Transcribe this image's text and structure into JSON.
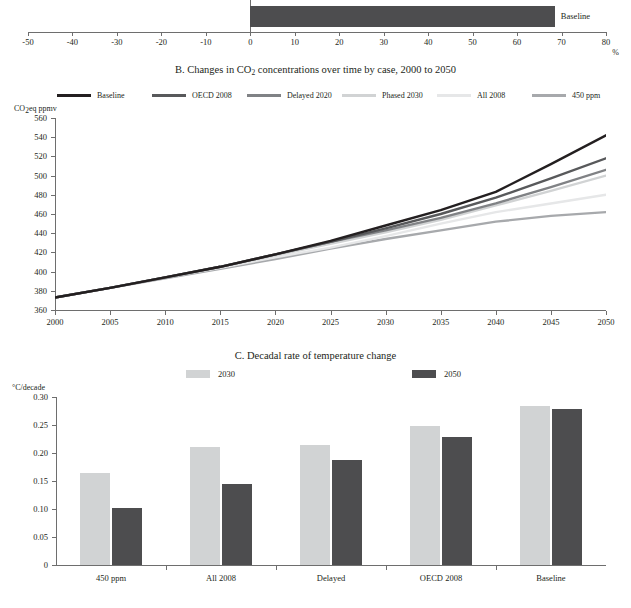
{
  "panel_a": {
    "series_label": "Baseline",
    "axis_unit": "%",
    "ticks": [
      "-50",
      "-40",
      "-30",
      "-20",
      "-10",
      "0",
      "10",
      "20",
      "30",
      "40",
      "50",
      "60",
      "70",
      "80"
    ],
    "bar_color": "#4d4d4f"
  },
  "panel_b": {
    "title_prefix": "B. Changes in CO",
    "title_sub": "2",
    "title_suffix": " concentrations over time by case, 2000 to 2050",
    "title_full": "B. Changes in CO2 concentrations over time by case, 2000 to 2050",
    "y_axis_label_prefix": "CO",
    "y_axis_label_sub": "2",
    "y_axis_label_suffix": "eq ppmv",
    "legend": [
      {
        "label": "Baseline",
        "color": "#231f20"
      },
      {
        "label": "OECD 2008",
        "color": "#58595b"
      },
      {
        "label": "Delayed 2020",
        "color": "#808285"
      },
      {
        "label": "Phased 2030",
        "color": "#d1d3d4"
      },
      {
        "label": "All 2008",
        "color": "#e6e7e8"
      },
      {
        "label": "450 ppm",
        "color": "#a7a9ac"
      }
    ]
  },
  "panel_c": {
    "title": "C. Decadal rate of temperature change",
    "y_axis_label": "°C/decade",
    "legend": [
      {
        "label": "2030",
        "color": "#d1d3d4"
      },
      {
        "label": "2050",
        "color": "#4d4d4f"
      }
    ]
  },
  "chart_data": [
    {
      "type": "bar",
      "id": "panel-a",
      "orientation": "horizontal",
      "title": "",
      "xlabel": "%",
      "ylabel": "",
      "categories": [
        "Baseline"
      ],
      "values": [
        68.5
      ],
      "xlim": [
        -50,
        80
      ],
      "xticks": [
        -50,
        -40,
        -30,
        -20,
        -10,
        0,
        10,
        20,
        30,
        40,
        50,
        60,
        70,
        80
      ],
      "grid": false,
      "legend_position": "right-inline",
      "note": "Panel A is cropped at the top of the screenshot; only the Baseline bar is visible."
    },
    {
      "type": "line",
      "id": "panel-b",
      "title": "B. Changes in CO2 concentrations over time by case, 2000 to 2050",
      "xlabel": "",
      "ylabel": "CO2eq ppmv",
      "x": [
        2000,
        2005,
        2010,
        2015,
        2020,
        2025,
        2030,
        2035,
        2040,
        2045,
        2050
      ],
      "xlim": [
        2000,
        2050
      ],
      "ylim": [
        360,
        560
      ],
      "yticks": [
        360,
        380,
        400,
        420,
        440,
        460,
        480,
        500,
        520,
        540,
        560
      ],
      "xticks": [
        2000,
        2005,
        2010,
        2015,
        2020,
        2025,
        2030,
        2035,
        2040,
        2045,
        2050
      ],
      "grid": false,
      "legend_position": "top",
      "series": [
        {
          "name": "Baseline",
          "color": "#231f20",
          "values": [
            373,
            383,
            394,
            405,
            418,
            432,
            448,
            464,
            483,
            512,
            542
          ]
        },
        {
          "name": "OECD 2008",
          "color": "#58595b",
          "values": [
            373,
            383,
            394,
            405,
            418,
            431,
            445,
            460,
            477,
            497,
            518
          ]
        },
        {
          "name": "Delayed 2020",
          "color": "#808285",
          "values": [
            373,
            383,
            394,
            405,
            418,
            431,
            443,
            456,
            471,
            488,
            506
          ]
        },
        {
          "name": "Phased 2030",
          "color": "#d1d3d4",
          "values": [
            373,
            383,
            394,
            405,
            417,
            429,
            441,
            454,
            469,
            484,
            500
          ]
        },
        {
          "name": "All 2008",
          "color": "#e6e7e8",
          "values": [
            373,
            383,
            394,
            404,
            415,
            425,
            437,
            450,
            462,
            471,
            480
          ]
        },
        {
          "name": "450 ppm",
          "color": "#a7a9ac",
          "values": [
            373,
            383,
            393,
            403,
            413,
            424,
            434,
            443,
            452,
            458,
            462
          ]
        }
      ]
    },
    {
      "type": "bar",
      "id": "panel-c",
      "title": "C. Decadal rate of temperature change",
      "xlabel": "",
      "ylabel": "°C/decade",
      "categories": [
        "450 ppm",
        "All 2008",
        "Delayed",
        "OECD 2008",
        "Baseline"
      ],
      "ylim": [
        0,
        0.3
      ],
      "yticks": [
        0,
        0.05,
        0.1,
        0.15,
        0.2,
        0.25,
        0.3
      ],
      "ytick_labels": [
        "0",
        "0.05",
        "0.10",
        "0.15",
        "0.20",
        "0.25",
        "0.30"
      ],
      "grid": false,
      "legend_position": "top",
      "series": [
        {
          "name": "2030",
          "color": "#d1d3d4",
          "values": [
            0.164,
            0.21,
            0.215,
            0.249,
            0.284
          ]
        },
        {
          "name": "2050",
          "color": "#4d4d4f",
          "values": [
            0.101,
            0.145,
            0.188,
            0.228,
            0.278
          ]
        }
      ]
    }
  ]
}
